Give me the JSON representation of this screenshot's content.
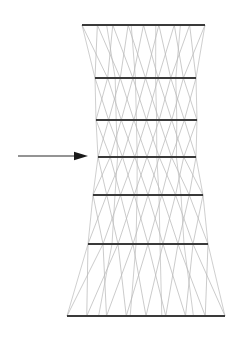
{
  "figure": {
    "canvas": {
      "width": 247,
      "height": 339
    },
    "background_color": "#ffffff"
  },
  "colors": {
    "ring_bar": "#3a3a3a",
    "diagonal_brace": "#b9b9b9",
    "leg_line": "#c3c3c3",
    "arrow": "#1a1a1a",
    "background": "#ffffff"
  },
  "tower": {
    "name": "waisted-lattice-tower",
    "ring_bar_count": 7,
    "panel_count": 6,
    "ring_bars": [
      {
        "id": "ring-bar-1",
        "level": "top",
        "y": 25,
        "x_left": 82,
        "x_right": 205
      },
      {
        "id": "ring-bar-2",
        "level": "2",
        "y": 78,
        "x_left": 95,
        "x_right": 196
      },
      {
        "id": "ring-bar-3",
        "level": "3",
        "y": 120,
        "x_left": 96,
        "x_right": 197
      },
      {
        "id": "ring-bar-4",
        "level": "waist",
        "y": 157,
        "x_left": 98,
        "x_right": 196
      },
      {
        "id": "ring-bar-5",
        "level": "5",
        "y": 195,
        "x_left": 93,
        "x_right": 203
      },
      {
        "id": "ring-bar-6",
        "level": "6",
        "y": 244,
        "x_left": 88,
        "x_right": 208
      },
      {
        "id": "ring-bar-7",
        "level": "base",
        "y": 316,
        "x_left": 67,
        "x_right": 225
      }
    ],
    "bracing": {
      "pattern": "zigzag-cross",
      "zigzags_per_panel": 4
    }
  },
  "load_arrow": {
    "name": "horizontal-load-arrow",
    "direction": "right",
    "y": 156,
    "x_start": 18,
    "x_tip": 88,
    "head_length": 14,
    "head_half_height": 4.2
  }
}
